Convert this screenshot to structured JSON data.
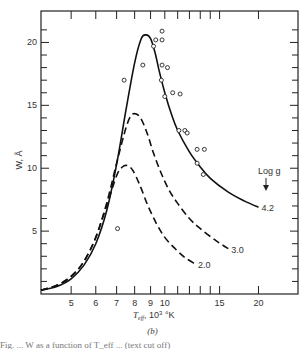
{
  "chart_data": {
    "type": "line",
    "title": "",
    "panel_label": "(b)",
    "xlabel": "T_eff, 10^3 °K",
    "xlabel_parts": {
      "main": "T",
      "sub": "eff",
      "rest": ", 10",
      "sup": "3",
      "unit": " °K"
    },
    "ylabel": "W, Å",
    "xscale": "log",
    "xlim": [
      4.0,
      26.8
    ],
    "ylim": [
      0,
      22.5
    ],
    "x_ticks_labeled": [
      5,
      6,
      7,
      8,
      9,
      10,
      15,
      20
    ],
    "x_ticks_minor": [
      11,
      12,
      13,
      14
    ],
    "y_ticks_labeled": [
      5,
      10,
      15,
      20
    ],
    "y_ticks_minor": [
      1,
      2,
      3,
      4,
      6,
      7,
      8,
      9,
      11,
      12,
      13,
      14,
      16,
      17,
      18,
      19,
      21
    ],
    "grid": false,
    "legend_title": "Log g",
    "series": [
      {
        "name": "4.2",
        "style": "solid",
        "x": [
          4.0,
          4.5,
          5.0,
          5.5,
          6.0,
          6.5,
          7.0,
          7.5,
          8.0,
          8.4,
          8.7,
          9.0,
          9.3,
          9.6,
          10.0,
          10.5,
          11.0,
          12.0,
          13.0,
          14.0,
          16.0,
          18.0,
          20.0
        ],
        "values": [
          0.3,
          0.6,
          1.2,
          2.3,
          4.0,
          6.6,
          10.3,
          14.6,
          18.4,
          20.3,
          20.6,
          20.3,
          19.2,
          17.7,
          16.0,
          14.3,
          13.0,
          11.3,
          10.1,
          9.2,
          8.1,
          7.4,
          6.9
        ]
      },
      {
        "name": "3.0",
        "style": "dashed",
        "x": [
          4.0,
          4.5,
          5.0,
          5.5,
          6.0,
          6.5,
          7.0,
          7.5,
          7.8,
          8.1,
          8.4,
          8.8,
          9.2,
          9.7,
          10.3,
          11.0,
          12.0,
          13.0,
          14.5,
          16.0
        ],
        "values": [
          0.3,
          0.7,
          1.4,
          2.6,
          4.5,
          7.2,
          10.4,
          13.2,
          14.2,
          14.3,
          13.9,
          12.7,
          11.2,
          9.7,
          8.3,
          7.2,
          6.0,
          5.2,
          4.3,
          3.6
        ]
      },
      {
        "name": "2.0",
        "style": "dashed",
        "x": [
          4.0,
          4.5,
          5.0,
          5.5,
          6.0,
          6.5,
          7.0,
          7.3,
          7.6,
          7.9,
          8.3,
          8.8,
          9.4,
          10.0,
          10.8,
          11.6,
          12.5
        ],
        "values": [
          0.3,
          0.7,
          1.4,
          2.6,
          4.5,
          7.0,
          9.4,
          10.1,
          10.2,
          9.8,
          8.7,
          7.1,
          5.6,
          4.5,
          3.6,
          2.9,
          2.4
        ]
      }
    ],
    "observations": {
      "name": "observed",
      "marker": "open-circle",
      "x": [
        7.05,
        7.4,
        8.5,
        9.2,
        9.35,
        9.8,
        9.8,
        9.8,
        10.2,
        9.75,
        10.0,
        10.6,
        11.2,
        11.1,
        11.6,
        11.8,
        12.7,
        13.4,
        12.7,
        13.3
      ],
      "y": [
        5.2,
        17.0,
        18.2,
        19.7,
        20.2,
        20.9,
        20.2,
        18.2,
        18.0,
        17.0,
        15.7,
        16.0,
        15.9,
        13.0,
        13.0,
        12.8,
        11.5,
        11.5,
        10.4,
        9.5
      ]
    }
  },
  "caption": {
    "panel": "(b)",
    "footer_fragment": "Fig. ... W as a function of T_eff ... (text cut off)"
  }
}
